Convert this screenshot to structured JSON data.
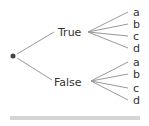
{
  "tree": {
    "root": {
      "x": 13,
      "y": 56
    },
    "branches": [
      {
        "label": "True",
        "label_x": 58,
        "label_y": 36,
        "from_x": 17,
        "from_y": 54,
        "to_x": 54,
        "to_y": 32,
        "hub_x": 88,
        "hub_y": 32,
        "leaves": [
          {
            "label": "a",
            "y": 12
          },
          {
            "label": "b",
            "y": 24
          },
          {
            "label": "c",
            "y": 36
          },
          {
            "label": "d",
            "y": 48
          }
        ]
      },
      {
        "label": "False",
        "label_x": 54,
        "label_y": 86,
        "from_x": 17,
        "from_y": 58,
        "to_x": 52,
        "to_y": 80,
        "hub_x": 91,
        "hub_y": 81,
        "leaves": [
          {
            "label": "a",
            "y": 62
          },
          {
            "label": "b",
            "y": 74
          },
          {
            "label": "c",
            "y": 88
          },
          {
            "label": "d",
            "y": 100
          }
        ]
      }
    ]
  },
  "colors": {
    "line": "#999999",
    "dot": "#444444",
    "text": "#333333",
    "rule": "#aaaaaa"
  }
}
